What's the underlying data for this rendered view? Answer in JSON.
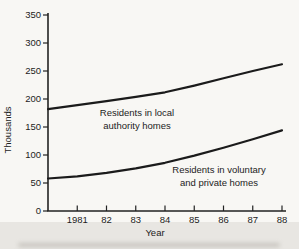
{
  "chart_data": {
    "type": "line",
    "title": "",
    "xlabel": "Year",
    "ylabel": "Thousands",
    "ylim": [
      0,
      350
    ],
    "grid": false,
    "legend_position": "inline-annotations",
    "y_ticks": [
      350,
      300,
      250,
      200,
      150,
      100,
      50,
      0
    ],
    "x_tick_labels": [
      "1981",
      "82",
      "83",
      "84",
      "85",
      "86",
      "87",
      "88"
    ],
    "x_tick_years": [
      1981,
      1982,
      1983,
      1984,
      1985,
      1986,
      1987,
      1988
    ],
    "x": [
      1980,
      1981,
      1982,
      1983,
      1984,
      1985,
      1986,
      1987,
      1988
    ],
    "series": [
      {
        "name": "Residents in local authority homes",
        "values": [
          182,
          189,
          196,
          204,
          212,
          224,
          237,
          250,
          262
        ]
      },
      {
        "name": "Residents in voluntary and private homes",
        "values": [
          58,
          62,
          68,
          76,
          86,
          99,
          113,
          128,
          144
        ]
      }
    ],
    "annotations": [
      {
        "line1": "Residents in local",
        "line2": "authority homes",
        "cx": 137,
        "y1": 116,
        "y2": 129
      },
      {
        "line1": "Residents in voluntary",
        "line2": "and private homes",
        "cx": 219,
        "y1": 173,
        "y2": 186
      }
    ],
    "line_color": "#1b1b1b",
    "axis_color": "#222222",
    "background_color": "#f8f7f4"
  }
}
